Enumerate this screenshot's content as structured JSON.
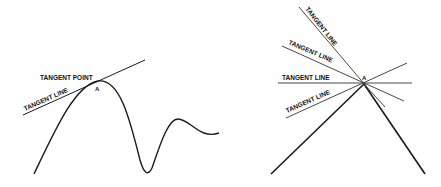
{
  "left_diagram": {
    "tangent_point_label": "TANGENT POINT",
    "tangent_line_label": "TANGENT LINE",
    "point_label": "A"
  },
  "right_diagram": {
    "tangent_line_labels": [
      "TANGENT LINE",
      "TANGENT LINE",
      "TANGENT LINE",
      "TANGENT LINE"
    ],
    "point_label": "A"
  },
  "colors": {
    "stroke": "#1a1a1a",
    "thin_stroke": "#333333",
    "background": "#ffffff"
  }
}
